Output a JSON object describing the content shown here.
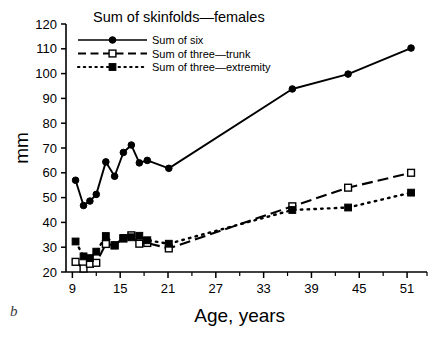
{
  "figure": {
    "panel_letter": "b",
    "title": "Sum of skinfolds—females",
    "xlabel": "Age, years",
    "ylabel": "mm"
  },
  "legend": {
    "position": "top-left-inside",
    "entries": [
      {
        "label": "Sum of six",
        "marker": "filled-circle",
        "line": "solid"
      },
      {
        "label": "Sum of three—trunk",
        "marker": "open-square",
        "line": "dashed"
      },
      {
        "label": "Sum of three—extremity",
        "marker": "filled-square",
        "line": "dotted"
      }
    ]
  },
  "chart_data": {
    "type": "line",
    "title": "Sum of skinfolds—females",
    "xlabel": "Age, years",
    "ylabel": "mm",
    "xlim": [
      8.2,
      53.5
    ],
    "ylim": [
      20,
      120
    ],
    "xticks": [
      9,
      15,
      21,
      27,
      33,
      39,
      45,
      51
    ],
    "xticks_minor": [
      12,
      18,
      24,
      30,
      36,
      42,
      48
    ],
    "yticks": [
      20,
      30,
      40,
      50,
      60,
      70,
      80,
      90,
      100,
      110,
      120
    ],
    "grid": false,
    "legend_position": "upper left",
    "series": [
      {
        "name": "Sum of six",
        "marker": "filled-circle",
        "line": "solid",
        "color": "#000000",
        "points": [
          [
            9.4,
            57.0
          ],
          [
            10.4,
            46.8
          ],
          [
            11.2,
            48.6
          ],
          [
            12.0,
            51.3
          ],
          [
            13.2,
            64.4
          ],
          [
            14.3,
            58.6
          ],
          [
            15.4,
            68.2
          ],
          [
            16.4,
            71.2
          ],
          [
            17.4,
            64.0
          ],
          [
            18.4,
            65.0
          ],
          [
            21.1,
            61.8
          ],
          [
            36.6,
            93.8
          ],
          [
            43.6,
            99.8
          ],
          [
            51.5,
            110.3
          ]
        ]
      },
      {
        "name": "Sum of three—trunk",
        "marker": "open-square",
        "line": "dashed",
        "color": "#000000",
        "points": [
          [
            9.4,
            24.1
          ],
          [
            10.4,
            21.4
          ],
          [
            11.2,
            23.3
          ],
          [
            12.0,
            23.7
          ],
          [
            13.2,
            31.3
          ],
          [
            14.3,
            30.7
          ],
          [
            15.4,
            33.5
          ],
          [
            16.4,
            34.8
          ],
          [
            17.4,
            31.4
          ],
          [
            18.4,
            31.7
          ],
          [
            21.1,
            29.5
          ],
          [
            36.6,
            46.5
          ],
          [
            43.6,
            54.0
          ],
          [
            51.5,
            60.0
          ]
        ]
      },
      {
        "name": "Sum of three—extremity",
        "marker": "filled-square",
        "line": "dotted",
        "color": "#000000",
        "points": [
          [
            9.4,
            32.3
          ],
          [
            10.4,
            26.3
          ],
          [
            11.2,
            25.6
          ],
          [
            12.0,
            28.2
          ],
          [
            13.2,
            34.5
          ],
          [
            14.3,
            30.8
          ],
          [
            15.4,
            33.7
          ],
          [
            16.4,
            34.0
          ],
          [
            17.4,
            34.6
          ],
          [
            18.4,
            32.8
          ],
          [
            21.1,
            31.4
          ],
          [
            36.6,
            45.0
          ],
          [
            43.6,
            46.0
          ],
          [
            51.5,
            52.0
          ]
        ]
      }
    ]
  }
}
